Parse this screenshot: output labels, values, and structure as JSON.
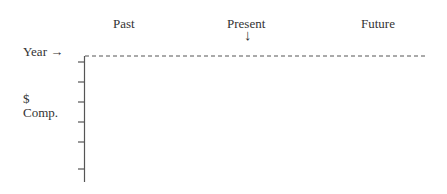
{
  "headers": {
    "past": "Past",
    "present": "Present",
    "future": "Future"
  },
  "present_marker": "↓",
  "x_axis_label": "Year →",
  "y_axis_label": {
    "line1": "$",
    "line2": "Comp."
  },
  "axis": {
    "x_line_style": "dashed",
    "y_ticks_count": 6,
    "color": "#444444"
  }
}
